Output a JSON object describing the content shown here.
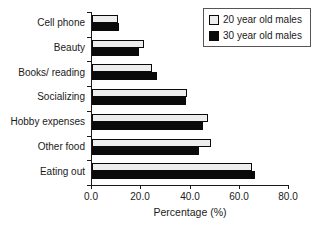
{
  "chart_data": {
    "type": "bar",
    "orientation": "horizontal",
    "title": "",
    "categories": [
      "Cell phone",
      "Beauty",
      "Books/ reading",
      "Socializing",
      "Hobby expenses",
      "Other food",
      "Eating out"
    ],
    "series": [
      {
        "name": "20 year old males",
        "color": "#ededed",
        "values": [
          10.5,
          21,
          24.5,
          38.5,
          47,
          48.5,
          65
        ]
      },
      {
        "name": "30 year old males",
        "color": "#0a0a0a",
        "values": [
          11,
          19,
          26.5,
          38,
          45,
          43.5,
          66
        ]
      }
    ],
    "xlabel": "Percentage (%)",
    "ylabel": "",
    "xlim": [
      0,
      80
    ],
    "xticks": [
      0,
      20,
      40,
      60,
      80
    ],
    "xtick_labels": [
      "0.0",
      "20.0",
      "40.0",
      "60.0",
      "80.0"
    ],
    "grid": false,
    "legend_position": "top-right"
  },
  "colors": {
    "bar_light": "#ededed",
    "bar_dark": "#0a0a0a",
    "axis": "#1a1a1a",
    "text": "#1a1a1a",
    "legend_border": "#555555",
    "background": "#ffffff"
  }
}
